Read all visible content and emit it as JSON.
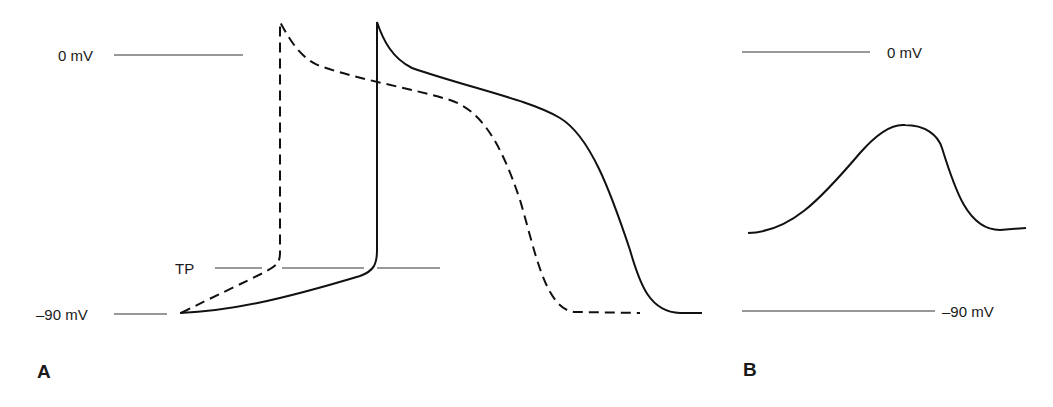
{
  "panel_a": {
    "label": "A",
    "ref_0": "0 mV",
    "ref_tp": "TP",
    "ref_90": "–90 mV",
    "traces": [
      {
        "name": "normal",
        "style": "solid"
      },
      {
        "name": "shifted",
        "style": "dashed"
      }
    ]
  },
  "panel_b": {
    "label": "B",
    "ref_0": "0 mV",
    "ref_90": "–90 mV"
  },
  "colors": {
    "line": "#111111",
    "ref_line": "#333333",
    "background": "#ffffff"
  }
}
